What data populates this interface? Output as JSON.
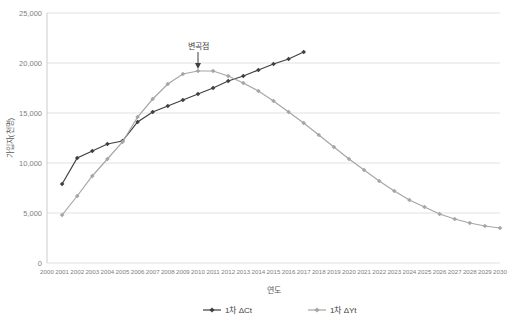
{
  "chart_data": {
    "type": "line",
    "title": "",
    "xlabel": "연도",
    "ylabel": "가입자(천명)",
    "ylim": [
      0,
      25000
    ],
    "yticks": [
      0,
      5000,
      10000,
      15000,
      20000,
      25000
    ],
    "ytick_labels": [
      "0",
      "5,000",
      "10,000",
      "15,000",
      "20,000",
      "25,000"
    ],
    "x": [
      2000,
      2001,
      2002,
      2003,
      2004,
      2005,
      2006,
      2007,
      2008,
      2009,
      2010,
      2011,
      2012,
      2013,
      2014,
      2015,
      2016,
      2017,
      2018,
      2019,
      2020,
      2021,
      2022,
      2023,
      2024,
      2025,
      2026,
      2027,
      2028,
      2029,
      2030
    ],
    "xtick_labels": [
      "2000",
      "2001",
      "2002",
      "2003",
      "2004",
      "2005",
      "2006",
      "2007",
      "2008",
      "2009",
      "2010",
      "2011",
      "2012",
      "2013",
      "2014",
      "2015",
      "2016",
      "2017",
      "2018",
      "2019",
      "2020",
      "2021",
      "2022",
      "2023",
      "2024",
      "2025",
      "2026",
      "2027",
      "2028",
      "2029",
      "2030"
    ],
    "grid": true,
    "legend_position": "bottom",
    "annotations": [
      {
        "text": "변곡점",
        "x": 2010,
        "y": 19200
      }
    ],
    "series": [
      {
        "name": "1차 ΔCt",
        "color": "#404040",
        "marker": "diamond",
        "x": [
          2001,
          2002,
          2003,
          2004,
          2005,
          2006,
          2007,
          2008,
          2009,
          2010,
          2011,
          2012,
          2013,
          2014,
          2015,
          2016,
          2017
        ],
        "values": [
          7900,
          10500,
          11200,
          11900,
          12200,
          14100,
          15100,
          15700,
          16300,
          16900,
          17500,
          18200,
          18700,
          19300,
          19900,
          20400,
          21100
        ]
      },
      {
        "name": "1차 ΔYt",
        "color": "#a6a6a6",
        "marker": "diamond",
        "x": [
          2001,
          2002,
          2003,
          2004,
          2005,
          2006,
          2007,
          2008,
          2009,
          2010,
          2011,
          2012,
          2013,
          2014,
          2015,
          2016,
          2017,
          2018,
          2019,
          2020,
          2021,
          2022,
          2023,
          2024,
          2025,
          2026,
          2027,
          2028,
          2029,
          2030
        ],
        "values": [
          4800,
          6700,
          8700,
          10400,
          12100,
          14600,
          16400,
          17900,
          18900,
          19200,
          19200,
          18700,
          18000,
          17200,
          16200,
          15100,
          14000,
          12800,
          11600,
          10400,
          9300,
          8200,
          7200,
          6300,
          5600,
          4900,
          4400,
          4000,
          3700,
          3500
        ]
      }
    ],
    "legend": [
      {
        "label": "1차 ΔCt",
        "color": "#404040"
      },
      {
        "label": "1차 ΔYt",
        "color": "#a6a6a6"
      }
    ]
  }
}
